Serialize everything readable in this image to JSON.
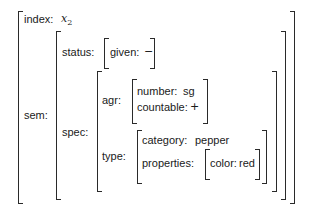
{
  "avm": {
    "index": {
      "label": "index:",
      "value": "x",
      "value_sub": "2"
    },
    "sem": {
      "label": "sem:",
      "status": {
        "label": "status:",
        "given": {
          "label": "given:",
          "value": "−"
        }
      },
      "spec": {
        "label": "spec:",
        "agr": {
          "label": "agr:",
          "number": {
            "label": "number:",
            "value": "sg"
          },
          "countable": {
            "label": "countable:",
            "value": "+"
          }
        },
        "type": {
          "label": "type:",
          "category": {
            "label": "category:",
            "value": "pepper"
          },
          "properties": {
            "label": "properties:",
            "color": {
              "label": "color:",
              "value": "red"
            }
          }
        }
      }
    }
  }
}
